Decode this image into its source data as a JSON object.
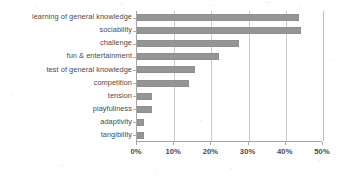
{
  "chart_data": {
    "type": "bar",
    "orientation": "horizontal",
    "title": "",
    "subtitle": "",
    "xlabel": "",
    "ylabel": "",
    "categories": [
      "learning of general knowledge",
      "sociability",
      "challenge",
      "fun & entertainment",
      "test of general knowledge",
      "competition",
      "tension",
      "playfullness",
      "adaptivity",
      "tangibility"
    ],
    "values": [
      43.5,
      44,
      27.5,
      22,
      15.5,
      14,
      4,
      4,
      2,
      2
    ],
    "value_suffix": "%",
    "xlim": [
      0,
      50
    ],
    "xticks": [
      0,
      10,
      20,
      30,
      40,
      50
    ],
    "xtick_labels": [
      "0%",
      "10%",
      "20%",
      "30%",
      "40%",
      "50%"
    ],
    "grid": true,
    "grid_axis": "x",
    "legend": false,
    "legend_position": "none",
    "series": [
      {
        "name": "",
        "values": [
          43.5,
          44,
          27.5,
          22,
          15.5,
          14,
          4,
          4,
          2,
          2
        ]
      }
    ]
  },
  "style": {
    "bar_color": "#959595",
    "grid_color": "#c9c9c9",
    "axis_color": "#a6a6a6",
    "text_color": "#4a4a4a",
    "background": "#ffffff"
  }
}
